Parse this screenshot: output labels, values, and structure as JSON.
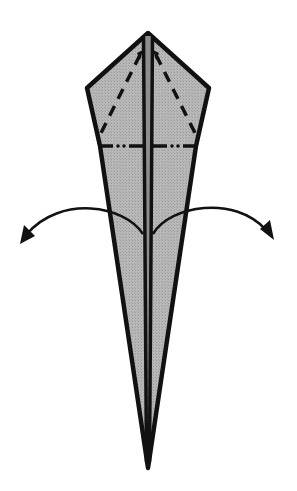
{
  "diagram": {
    "type": "origami-fold-step",
    "colors": {
      "paper_fill": "#b3b3b3",
      "outline": "#111111",
      "background": "#ffffff"
    },
    "shape": {
      "apex": [
        148,
        33
      ],
      "left_corner": [
        87,
        88
      ],
      "right_corner": [
        209,
        88
      ],
      "bottom_tip": [
        148,
        468
      ]
    },
    "folds": [
      {
        "name": "valley-fold-left",
        "style": "dashed"
      },
      {
        "name": "valley-fold-right",
        "style": "dashed"
      },
      {
        "name": "mountain-fold-horizontal",
        "style": "dash-dot-dot"
      }
    ],
    "arrows": [
      {
        "name": "unfold-left-arrow",
        "direction": "left"
      },
      {
        "name": "unfold-right-arrow",
        "direction": "right"
      }
    ]
  }
}
